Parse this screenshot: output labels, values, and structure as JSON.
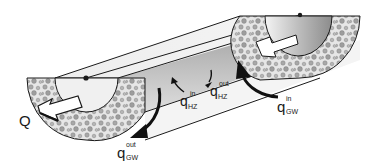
{
  "diagram": {
    "labels": {
      "Q": "Q",
      "q_hz_in": {
        "base": "q",
        "sup": "in",
        "sub": "HZ"
      },
      "q_hz_out": {
        "base": "q",
        "sup": "out",
        "sub": "HZ"
      },
      "q_gw_in": {
        "base": "q",
        "sup": "in",
        "sub": "GW"
      },
      "q_gw_out": {
        "base": "q",
        "sup": "out",
        "sub": "GW"
      }
    },
    "colors": {
      "outline": "#1a1a1a",
      "sediment_fill": "#d0d0d0",
      "pebble": "#9a9a9a",
      "water_light": "#f2f2f2",
      "water_dark": "#8a8a8a",
      "arrow": "#111111"
    }
  }
}
